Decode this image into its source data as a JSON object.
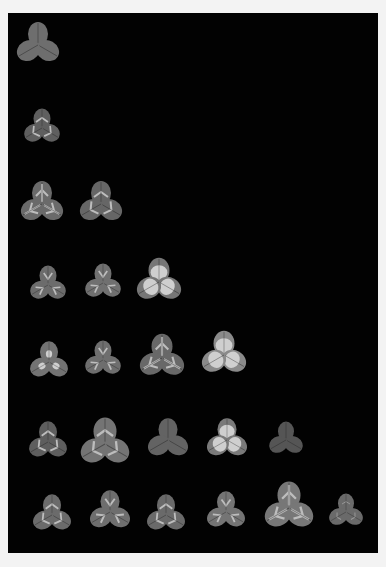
{
  "image": {
    "description": "Grayscale photograph of trifoliate clover leaves arranged in rows on a black background",
    "background": "#020202",
    "border": "#f3f3f3",
    "rows": [
      {
        "count": 1,
        "leaves": [
          {
            "x": 38,
            "y": 45,
            "s": 1.0,
            "mark": "none",
            "tone": "#6e6e6e"
          }
        ]
      },
      {
        "count": 1,
        "leaves": [
          {
            "x": 42,
            "y": 128,
            "s": 0.85,
            "mark": "chevron",
            "tone": "#5f5f5f"
          }
        ]
      },
      {
        "count": 2,
        "leaves": [
          {
            "x": 42,
            "y": 204,
            "s": 1.0,
            "mark": "stripe",
            "tone": "#6a6a6a"
          },
          {
            "x": 101,
            "y": 204,
            "s": 1.0,
            "mark": "chevron",
            "tone": "#666666"
          }
        ]
      },
      {
        "count": 3,
        "leaves": [
          {
            "x": 48,
            "y": 285,
            "s": 0.85,
            "mark": "v",
            "tone": "#6c6c6c"
          },
          {
            "x": 103,
            "y": 283,
            "s": 0.85,
            "mark": "v",
            "tone": "#707070"
          },
          {
            "x": 159,
            "y": 282,
            "s": 1.05,
            "mark": "blotch",
            "tone": "#767676"
          }
        ]
      },
      {
        "count": 4,
        "leaves": [
          {
            "x": 49,
            "y": 362,
            "s": 0.9,
            "mark": "blotch-small",
            "tone": "#737373"
          },
          {
            "x": 103,
            "y": 360,
            "s": 0.85,
            "mark": "v",
            "tone": "#6e6e6e"
          },
          {
            "x": 162,
            "y": 358,
            "s": 1.05,
            "mark": "stripe",
            "tone": "#686868"
          },
          {
            "x": 224,
            "y": 355,
            "s": 1.05,
            "mark": "blotch",
            "tone": "#8a8a8a"
          }
        ]
      },
      {
        "count": 5,
        "leaves": [
          {
            "x": 48,
            "y": 442,
            "s": 0.9,
            "mark": "chevron",
            "tone": "#5e5e5e"
          },
          {
            "x": 105,
            "y": 444,
            "s": 1.15,
            "mark": "chevron",
            "tone": "#747474"
          },
          {
            "x": 168,
            "y": 440,
            "s": 0.95,
            "mark": "none",
            "tone": "#636363"
          },
          {
            "x": 227,
            "y": 440,
            "s": 0.95,
            "mark": "blotch",
            "tone": "#7a7a7a"
          },
          {
            "x": 286,
            "y": 440,
            "s": 0.8,
            "mark": "none",
            "tone": "#555555"
          }
        ]
      },
      {
        "count": 6,
        "leaves": [
          {
            "x": 52,
            "y": 515,
            "s": 0.9,
            "mark": "chevron",
            "tone": "#6b6b6b"
          },
          {
            "x": 110,
            "y": 512,
            "s": 0.95,
            "mark": "v",
            "tone": "#6e6e6e"
          },
          {
            "x": 166,
            "y": 515,
            "s": 0.9,
            "mark": "chevron",
            "tone": "#6a6a6a"
          },
          {
            "x": 226,
            "y": 512,
            "s": 0.9,
            "mark": "v",
            "tone": "#747474"
          },
          {
            "x": 289,
            "y": 508,
            "s": 1.15,
            "mark": "stripe",
            "tone": "#777777"
          },
          {
            "x": 346,
            "y": 512,
            "s": 0.8,
            "mark": "faint",
            "tone": "#6a6a6a"
          }
        ]
      }
    ]
  }
}
